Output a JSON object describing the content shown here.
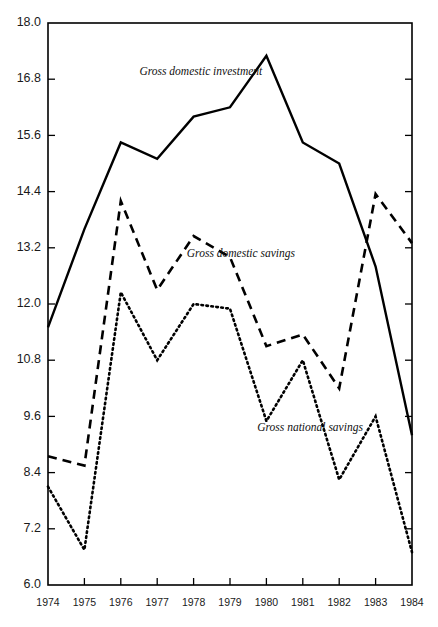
{
  "chart_data": {
    "type": "line",
    "title": "",
    "xlabel": "",
    "ylabel": "",
    "categories": [
      "1974",
      "1975",
      "1976",
      "1977",
      "1978",
      "1979",
      "1980",
      "1981",
      "1982",
      "1983",
      "1984"
    ],
    "x": [
      1974,
      1975,
      1976,
      1977,
      1978,
      1979,
      1980,
      1981,
      1982,
      1983,
      1984
    ],
    "xlim": [
      1974,
      1984
    ],
    "ylim": [
      6.0,
      18.0
    ],
    "yticks": [
      "18.0",
      "16.8",
      "15.6",
      "14.4",
      "13.2",
      "12.0",
      "10.8",
      "9.6",
      "8.4",
      "7.2",
      "6.0"
    ],
    "ytick_values": [
      18.0,
      16.8,
      15.6,
      14.4,
      13.2,
      12.0,
      10.8,
      9.6,
      8.4,
      7.2,
      6.0
    ],
    "grid": false,
    "legend_position": "inline-annotations",
    "series": [
      {
        "name": "Gross domestic investment",
        "style": "solid",
        "color": "#000000",
        "values": [
          11.5,
          13.6,
          15.45,
          15.1,
          16.0,
          16.2,
          17.3,
          15.45,
          15.0,
          12.8,
          9.2
        ]
      },
      {
        "name": "Gross domestic savings",
        "style": "dashed",
        "color": "#000000",
        "values": [
          8.75,
          8.55,
          14.2,
          12.3,
          13.45,
          13.0,
          11.1,
          11.35,
          10.2,
          14.35,
          13.3
        ]
      },
      {
        "name": "Gross national savings",
        "style": "dotted",
        "color": "#000000",
        "values": [
          8.1,
          6.75,
          12.25,
          10.8,
          12.0,
          11.9,
          9.5,
          10.8,
          8.25,
          9.6,
          6.7
        ]
      }
    ],
    "annotations": [
      {
        "text": "Gross domestic investment",
        "x": 1978.2,
        "y": 16.95
      },
      {
        "text": "Gross domestic savings",
        "x": 1979.3,
        "y": 13.05
      },
      {
        "text": "Gross national savings",
        "x": 1981.2,
        "y": 9.35
      }
    ]
  }
}
